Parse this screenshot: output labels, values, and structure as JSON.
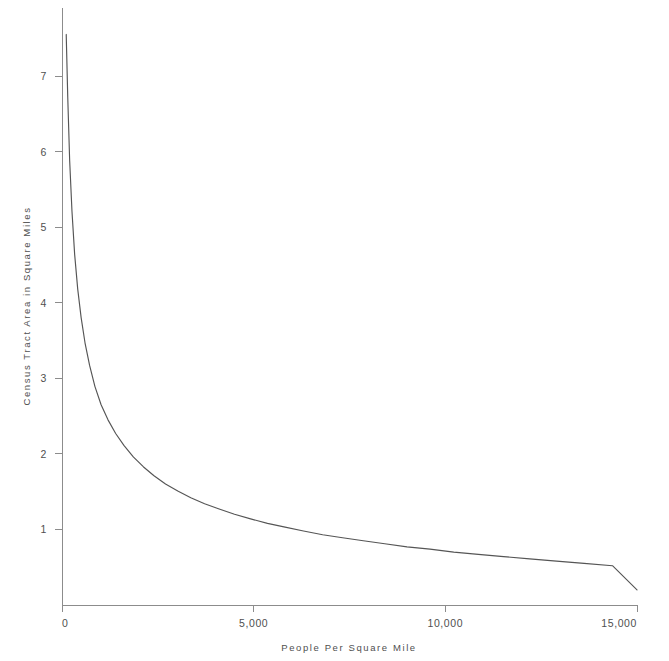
{
  "chart_data": {
    "type": "line",
    "title": "",
    "subtitle": "",
    "xlabel": "People Per Square Mile",
    "ylabel": "Census Tract Area in Square Miles",
    "xlim": [
      0,
      15000
    ],
    "ylim": [
      0,
      7.9
    ],
    "grid": false,
    "legend": null,
    "xticks": [
      0,
      5000,
      10000,
      15000
    ],
    "xticklabels": [
      "0",
      "5,000",
      "10,000",
      "15,000"
    ],
    "yticks": [
      1,
      2,
      3,
      4,
      5,
      6,
      7
    ],
    "yticklabels": [
      "1",
      "2",
      "3",
      "4",
      "5",
      "6",
      "7"
    ],
    "series": [
      {
        "name": "Census tract area",
        "color": "#555555",
        "x": [
          110,
          150,
          200,
          260,
          330,
          410,
          500,
          600,
          720,
          860,
          1020,
          1200,
          1400,
          1620,
          1860,
          2120,
          2400,
          2700,
          3020,
          3360,
          3720,
          4100,
          4500,
          4920,
          5360,
          5820,
          6300,
          6800,
          7320,
          7860,
          8420,
          9000,
          9600,
          10220,
          10860,
          11520,
          12200,
          12900,
          13620,
          14360,
          15000
        ],
        "y": [
          7.55,
          6.72,
          5.88,
          5.21,
          4.64,
          4.18,
          3.8,
          3.47,
          3.17,
          2.89,
          2.65,
          2.45,
          2.27,
          2.11,
          1.96,
          1.83,
          1.71,
          1.6,
          1.51,
          1.42,
          1.34,
          1.27,
          1.2,
          1.14,
          1.08,
          1.03,
          0.98,
          0.93,
          0.89,
          0.85,
          0.81,
          0.77,
          0.74,
          0.7,
          0.67,
          0.64,
          0.61,
          0.58,
          0.55,
          0.52,
          0.2
        ]
      }
    ]
  },
  "axes": {
    "x_label": "People Per Square Mile",
    "y_label": "Census Tract Area in Square Miles"
  },
  "colors": {
    "curve": "#555555",
    "axis": "#8c8c8c",
    "text": "#4f4f4f",
    "background": "#ffffff"
  }
}
